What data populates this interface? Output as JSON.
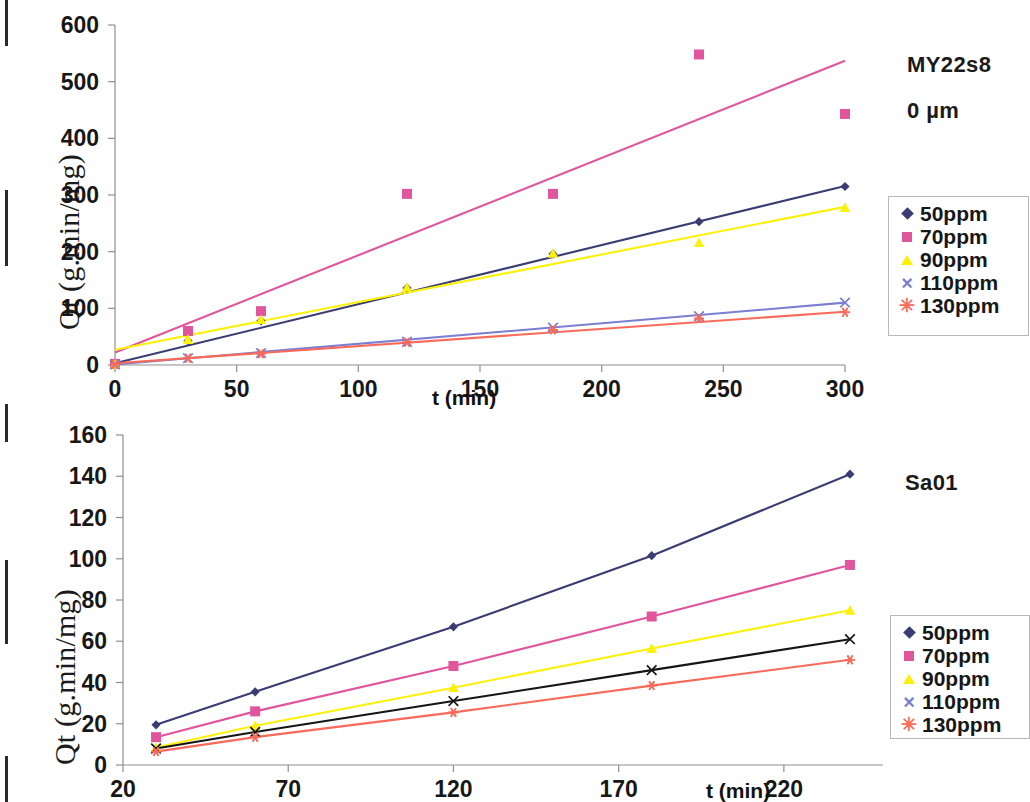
{
  "figure": {
    "edge_marks": [
      {
        "top": 0,
        "height": 46
      },
      {
        "top": 190,
        "height": 76
      },
      {
        "top": 404,
        "height": 38
      },
      {
        "top": 560,
        "height": 84
      },
      {
        "top": 756,
        "height": 46
      }
    ]
  },
  "series_style": {
    "c50": "#3b3d72",
    "c70": "#e0559c",
    "c90": "#fbf10a",
    "c110": "#7a7fd1",
    "c130": "#f96a5a",
    "c110_bottom": "#151515",
    "axis": "#8f8f8f",
    "text": "#171717"
  },
  "chart_data": [
    {
      "id": "top",
      "type": "scatter",
      "title": "",
      "annotation_lines": [
        "MY22s8",
        "0 µm"
      ],
      "xlabel": "t (min)",
      "ylabel": "Qt (g.min/mg)",
      "xlim": [
        0,
        300
      ],
      "ylim": [
        0,
        600
      ],
      "xticks": [
        0,
        50,
        100,
        150,
        200,
        250,
        300
      ],
      "yticks": [
        0,
        100,
        200,
        300,
        400,
        500,
        600
      ],
      "grid": false,
      "legend_position": "right",
      "series": [
        {
          "name": "50ppm",
          "color": "#3b3d72",
          "marker": "diamond",
          "x": [
            0,
            30,
            60,
            120,
            180,
            240,
            300
          ],
          "y": [
            1,
            43,
            78,
            136,
            196,
            253,
            315
          ],
          "trend": {
            "x0": 0,
            "y0": 3,
            "x1": 300,
            "y1": 316
          }
        },
        {
          "name": "70ppm",
          "color": "#e0559c",
          "marker": "square",
          "x": [
            0,
            30,
            60,
            120,
            180,
            240,
            300
          ],
          "y": [
            2,
            60,
            95,
            302,
            302,
            548,
            443
          ],
          "trend": {
            "x0": 0,
            "y0": 22,
            "x1": 300,
            "y1": 537
          }
        },
        {
          "name": "90ppm",
          "color": "#fbf10a",
          "marker": "triangle",
          "x": [
            0,
            30,
            60,
            120,
            180,
            240,
            300
          ],
          "y": [
            1,
            45,
            80,
            137,
            197,
            216,
            278
          ],
          "trend": {
            "x0": 0,
            "y0": 27,
            "x1": 300,
            "y1": 279
          }
        },
        {
          "name": "110ppm",
          "color": "#7a7fd1",
          "marker": "x",
          "x": [
            0,
            30,
            60,
            120,
            180,
            240,
            300
          ],
          "y": [
            1,
            12,
            21,
            41,
            66,
            86,
            110
          ],
          "trend": {
            "x0": 0,
            "y0": 1,
            "x1": 300,
            "y1": 110
          }
        },
        {
          "name": "130ppm",
          "color": "#f96a5a",
          "marker": "star",
          "x": [
            0,
            30,
            60,
            120,
            180,
            240,
            300
          ],
          "y": [
            1,
            12,
            20,
            40,
            62,
            82,
            93
          ],
          "trend": {
            "x0": 0,
            "y0": 3,
            "x1": 300,
            "y1": 94
          }
        }
      ]
    },
    {
      "id": "bottom",
      "type": "line",
      "title": "",
      "annotation_lines": [
        "Sa01"
      ],
      "xlabel": "t (min)",
      "ylabel": "Qt (g.min/mg)",
      "xlim": [
        20,
        250
      ],
      "ylim": [
        0,
        160
      ],
      "xticks": [
        20,
        70,
        120,
        170,
        220
      ],
      "yticks": [
        0,
        20,
        40,
        60,
        80,
        100,
        120,
        140,
        160
      ],
      "grid": false,
      "legend_position": "right",
      "series": [
        {
          "name": "50ppm",
          "color": "#3b3d72",
          "marker": "diamond",
          "x": [
            30,
            60,
            120,
            180,
            240
          ],
          "y": [
            19.5,
            35.5,
            67,
            101.5,
            141
          ]
        },
        {
          "name": "70ppm",
          "color": "#e0559c",
          "marker": "square",
          "x": [
            30,
            60,
            120,
            180,
            240
          ],
          "y": [
            13.5,
            26,
            48,
            72,
            97
          ]
        },
        {
          "name": "90ppm",
          "color": "#fbf10a",
          "marker": "triangle",
          "x": [
            30,
            60,
            120,
            180,
            240
          ],
          "y": [
            8.5,
            19,
            37.5,
            56.5,
            75
          ]
        },
        {
          "name": "110ppm",
          "color": "#151515",
          "marker": "x",
          "x": [
            30,
            60,
            120,
            180,
            240
          ],
          "y": [
            8,
            16,
            31,
            46,
            61
          ]
        },
        {
          "name": "130ppm",
          "color": "#f96a5a",
          "marker": "star",
          "x": [
            30,
            60,
            120,
            180,
            240
          ],
          "y": [
            6.5,
            13.5,
            25.5,
            38.5,
            51
          ]
        }
      ]
    }
  ]
}
